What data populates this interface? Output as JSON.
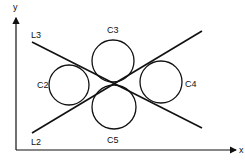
{
  "diagram": {
    "type": "geometry",
    "colors": {
      "stroke": "#111111",
      "background": "#ffffff"
    },
    "axes": {
      "x": {
        "label": "x",
        "origin": [
          16,
          150
        ],
        "end": [
          236,
          150
        ]
      },
      "y": {
        "label": "y",
        "origin": [
          16,
          150
        ],
        "end": [
          16,
          18
        ]
      }
    },
    "lines": [
      {
        "label": "L3",
        "from": [
          32,
          42
        ],
        "to": [
          202,
          128
        ],
        "label_pos": [
          31,
          38
        ]
      },
      {
        "label": "L2",
        "from": [
          32,
          133
        ],
        "to": [
          202,
          31
        ],
        "label_pos": [
          31,
          145
        ]
      }
    ],
    "circles": [
      {
        "label": "C2",
        "cx": 69,
        "cy": 85,
        "r": 20,
        "label_pos": [
          37,
          88
        ]
      },
      {
        "label": "C3",
        "cx": 113,
        "cy": 61,
        "r": 21,
        "label_pos": [
          107,
          33
        ]
      },
      {
        "label": "C4",
        "cx": 161,
        "cy": 82,
        "r": 21,
        "label_pos": [
          185,
          87
        ]
      },
      {
        "label": "C5",
        "cx": 114,
        "cy": 107,
        "r": 22,
        "label_pos": [
          107,
          143
        ]
      }
    ]
  }
}
